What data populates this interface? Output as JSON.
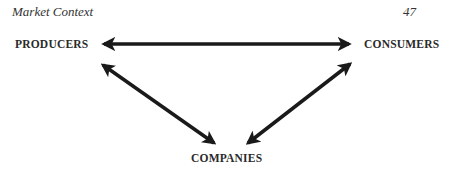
{
  "header": {
    "title": "Market Context",
    "page_number": "47"
  },
  "diagram": {
    "nodes": [
      {
        "id": "producers",
        "label": "PRODUCERS"
      },
      {
        "id": "consumers",
        "label": "CONSUMERS"
      },
      {
        "id": "companies",
        "label": "COMPANIES"
      }
    ],
    "edges": [
      {
        "from": "producers",
        "to": "consumers",
        "type": "bidirectional-arrow"
      },
      {
        "from": "producers",
        "to": "companies",
        "type": "bidirectional-arrow"
      },
      {
        "from": "consumers",
        "to": "companies",
        "type": "bidirectional-arrow"
      }
    ],
    "arrow_color": "#1a1a1a"
  }
}
